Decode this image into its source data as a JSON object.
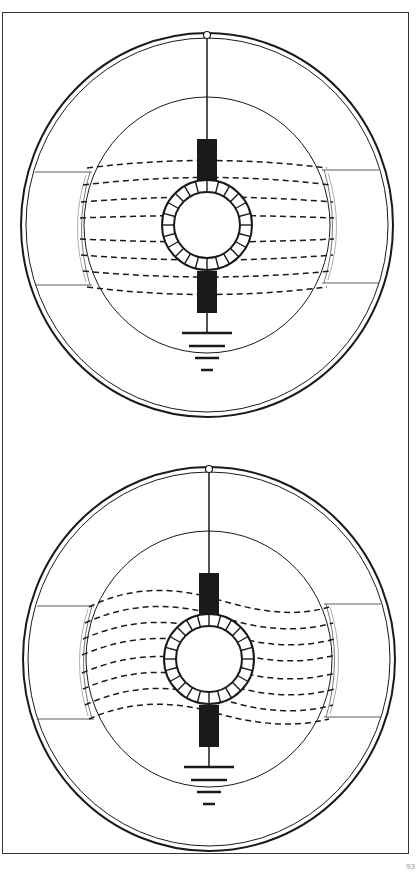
{
  "figure": {
    "page_number": "93",
    "panels": [
      {
        "name": "top-panel",
        "state": "uniform field (straight field lines)",
        "dashed_line_count": 8
      },
      {
        "name": "bottom-panel",
        "state": "distorted field (wavy field lines)",
        "dashed_line_count": 8
      }
    ],
    "components": [
      "outer-double-ring",
      "top-terminal",
      "vertical-wire",
      "inner-circle",
      "pole-piece-upper",
      "pole-piece-lower",
      "segmented-armature-ring",
      "ground-symbol",
      "field-lines",
      "side-pole-arcs"
    ],
    "colors": {
      "ink": "#1a1a1a",
      "paper": "#ffffff",
      "frame": "#333333"
    }
  }
}
